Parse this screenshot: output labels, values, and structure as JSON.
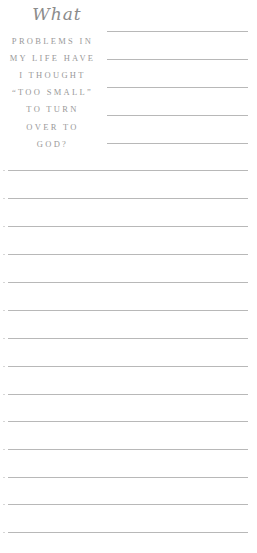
{
  "prompt": {
    "script_word": "What",
    "lines": [
      "PROBLEMS IN",
      "MY LIFE HAVE",
      "I THOUGHT",
      "“TOO SMALL”",
      "TO TURN",
      "OVER TO",
      "GOD?"
    ]
  },
  "writing_lines": {
    "short_count": 5,
    "full_count": 14
  },
  "colors": {
    "script_text": "#8c8c8c",
    "caps_text": "#9a9a9a",
    "rule": "#b8b8b8",
    "background": "#ffffff"
  }
}
